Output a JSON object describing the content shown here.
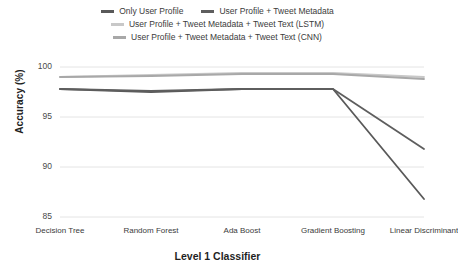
{
  "chart_data": {
    "type": "line",
    "title": "",
    "xlabel": "Level 1 Classifier",
    "ylabel": "Accuracy (%)",
    "categories": [
      "Decision Tree",
      "Random Forest",
      "Ada Boost",
      "Gradient Boosting",
      "Linear Discriminant"
    ],
    "ylim": [
      85,
      100
    ],
    "yticks": [
      85,
      90,
      95,
      100
    ],
    "grid": true,
    "legend_position": "top",
    "series": [
      {
        "name": "Only User Profile",
        "color": "#595959",
        "values": [
          97.8,
          97.5,
          97.8,
          97.8,
          86.8
        ]
      },
      {
        "name": "User Profile + Tweet Metadata",
        "color": "#5e5e5e",
        "values": [
          97.8,
          97.6,
          97.8,
          97.8,
          91.8
        ]
      },
      {
        "name": "User Profile + Tweet Metadata + Tweet Text (LSTM)",
        "color": "#c8c8c8",
        "values": [
          99.0,
          99.2,
          99.4,
          99.4,
          99.0
        ]
      },
      {
        "name": "User Profile + Tweet Metadata + Tweet Text (CNN)",
        "color": "#a8a8a8",
        "values": [
          99.0,
          99.1,
          99.3,
          99.3,
          98.8
        ]
      }
    ]
  },
  "legend": {
    "rows": [
      [
        {
          "label": "Only User Profile",
          "color": "#595959"
        },
        {
          "label": "User Profile + Tweet Metadata",
          "color": "#5e5e5e"
        }
      ],
      [
        {
          "label": "User Profile + Tweet Metadata + Tweet Text (LSTM)",
          "color": "#c8c8c8"
        }
      ],
      [
        {
          "label": "User Profile + Tweet Metadata + Tweet Text (CNN)",
          "color": "#a8a8a8"
        }
      ]
    ]
  },
  "axes": {
    "y_title": "Accuracy (%)",
    "x_title": "Level 1 Classifier",
    "y_ticks": [
      "100",
      "95",
      "90",
      "85"
    ],
    "x_ticks": [
      "Decision Tree",
      "Random Forest",
      "Ada Boost",
      "Gradient Boosting",
      "Linear Discriminant"
    ]
  },
  "style": {
    "grid_color": "#e4e4e4",
    "text_color": "#3b3b3b",
    "background": "#ffffff"
  }
}
